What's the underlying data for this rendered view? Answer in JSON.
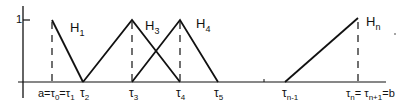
{
  "diagram": {
    "y_tick_label": "1",
    "functions": [
      {
        "name": "H_1",
        "label": "H",
        "sub": "1"
      },
      {
        "name": "H_3",
        "label": "H",
        "sub": "3"
      },
      {
        "name": "H_4",
        "label": "H",
        "sub": "4"
      },
      {
        "name": "H_n",
        "label": "H",
        "sub": "n"
      }
    ],
    "x_labels": {
      "tau0": {
        "main": "a=τ",
        "sub": "0"
      },
      "tau1": {
        "main": "=τ",
        "sub": "1"
      },
      "tau2": {
        "main": "τ",
        "sub": "2"
      },
      "tau3": {
        "main": "τ",
        "sub": "3"
      },
      "tau4": {
        "main": "τ",
        "sub": "4"
      },
      "tau5": {
        "main": "τ",
        "sub": "5"
      },
      "taun1": {
        "main": "τ",
        "sub": "n-1"
      },
      "taun": {
        "main": "τ",
        "sub": "n"
      },
      "taunp1": {
        "main": "= τ",
        "sub": "n+1"
      },
      "b": "=b"
    },
    "colors": {
      "line": "#111111",
      "background": "#ffffff"
    }
  }
}
